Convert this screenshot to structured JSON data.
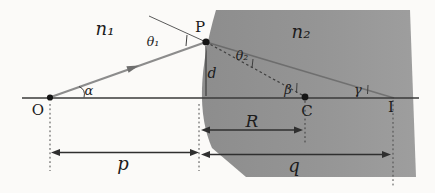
{
  "figure": {
    "media_labels": {
      "n1": "n₁",
      "n2": "n₂"
    },
    "points": {
      "O": "O",
      "P": "P",
      "C": "C",
      "I": "I"
    },
    "angles": {
      "alpha": "α",
      "beta": "β",
      "gamma": "γ",
      "theta1": "θ₁",
      "theta2": "θ₂"
    },
    "distances": {
      "d": "d",
      "R": "R",
      "p": "p",
      "q": "q"
    },
    "colors": {
      "background": "#fbfaf8",
      "medium2_fill": "#949494",
      "incident_ray": "#8c8c8c",
      "line": "#3a3a3a",
      "text": "#1c1c1c"
    }
  }
}
